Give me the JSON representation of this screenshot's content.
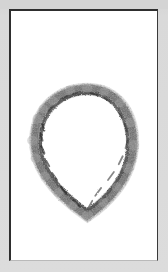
{
  "page": {
    "background_color": "#d6d6d6",
    "width": 168,
    "height": 272
  },
  "top_text_bleed": {
    "name": "cut-off-text-row",
    "text": "",
    "description": "faint partially-cropped line of text bleeding in from the page above",
    "color": "#c9c9c9"
  },
  "plate": {
    "name": "figure-plate",
    "background_color": "#ffffff",
    "border_color": "#2e2e2e",
    "bounds": {
      "x": 9,
      "y": 9,
      "width": 149,
      "height": 252
    }
  },
  "artwork": {
    "name": "teardrop-loop-sketch",
    "title": "",
    "medium": "charcoal-pencil-sketch",
    "shape": "closed teardrop / inverted pear loop",
    "stroke_color": "#6f6f6f",
    "stroke_dark_color": "#2a2a2a",
    "stroke_light_color": "#bdbdbd",
    "bounds": {
      "x": 30,
      "y": 86,
      "width": 104,
      "height": 132
    },
    "apex_point": {
      "x": 87,
      "y": 216
    },
    "top_arch_y": 88,
    "leftmost_x": 33,
    "rightmost_x": 133,
    "path": "M 87 88 C 59 88, 36 107, 34 137 C 32 166, 52 192, 87 216 C 122 192, 136 163, 133 134 C 130 106, 112 88, 87 88 Z"
  }
}
